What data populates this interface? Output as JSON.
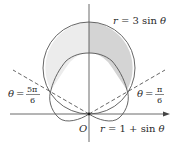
{
  "diagram": {
    "curves": [
      {
        "name": "circle",
        "equation": "r = 3 sin θ"
      },
      {
        "name": "cardioid",
        "equation": "r = 1 + sin θ"
      }
    ],
    "rays": [
      {
        "name": "ray-pi-over-6",
        "theta_lhs": "θ =",
        "numerator": "π",
        "denominator": "6"
      },
      {
        "name": "ray-5pi-over-6",
        "theta_lhs": "θ =",
        "numerator": "5π",
        "denominator": "6"
      }
    ],
    "origin_label": "O",
    "labels": {
      "circle": {
        "r": "r",
        "eq": "= 3 sin",
        "theta": "θ"
      },
      "cardioid": {
        "r": "r",
        "eq": "= 1 + sin",
        "theta": "θ"
      },
      "right_ray": {
        "theta": "θ",
        "eq": "=",
        "num": "π",
        "den": "6"
      },
      "left_ray": {
        "theta": "θ",
        "eq": "=",
        "num": "5π",
        "den": "6"
      }
    },
    "colors": {
      "stroke": "#555555",
      "shade_left": "#ececec",
      "shade_right": "#d6d6d6",
      "axis": "#444444"
    }
  }
}
